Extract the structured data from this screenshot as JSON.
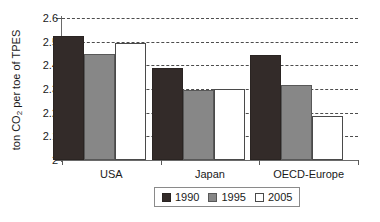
{
  "chart_data": {
    "type": "bar",
    "title": "",
    "subtitle": "",
    "xlabel": "",
    "ylabel": "ton CO2 per toe of TPES",
    "ylabel_parts": {
      "pre": "ton CO",
      "sub": "2",
      "post": " per toe of TPES"
    },
    "categories": [
      "USA",
      "Japan",
      "OECD-Europe"
    ],
    "series": [
      {
        "name": "1990",
        "color": "#332b29",
        "values": [
          2.525,
          2.39,
          2.445
        ]
      },
      {
        "name": "1995",
        "color": "#878787",
        "values": [
          2.45,
          2.295,
          2.318
        ]
      },
      {
        "name": "2005",
        "color": "#ffffff",
        "values": [
          2.495,
          2.298,
          2.185
        ]
      }
    ],
    "ylim": [
      2.0,
      2.6
    ],
    "ytick_values": [
      2.0,
      2.1,
      2.2,
      2.3,
      2.4,
      2.5,
      2.6
    ],
    "ytick_labels": [
      "2",
      "2.1",
      "2.2",
      "2.3",
      "2.4",
      "2.5",
      "2.6"
    ],
    "grid": true,
    "grid_axis": "y",
    "grid_style": "dashed",
    "legend_position": "bottom-center",
    "legend_entries": [
      "1990",
      "1995",
      "2005"
    ],
    "bar_mode": "grouped"
  }
}
